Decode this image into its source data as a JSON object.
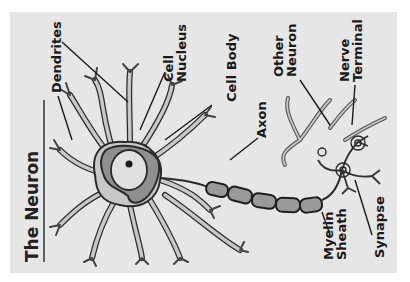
{
  "diagram": {
    "title": "The Neuron",
    "orientation": "rotated 90° counter-clockwise",
    "colors": {
      "panel_background": "#e6e6e6",
      "cell_fill": "#c8c8c8",
      "outline": "#2a2a2a",
      "nucleus_fill": "#e0e0e0",
      "myelin_fill": "#9a9a9a",
      "body_inner": "#8f8f8f"
    },
    "labels": {
      "dendrites": "Dendrites",
      "cell_nucleus_line1": "Cell",
      "cell_nucleus_line2": "Nucleus",
      "cell_body": "Cell Body",
      "axon": "Axon",
      "other_neuron_line1": "Other",
      "other_neuron_line2": "Neuron",
      "nerve_terminal_line1": "Nerve",
      "nerve_terminal_line2": "Terminal",
      "myelin_sheath_line1": "Myelin",
      "myelin_sheath_line2": "Sheath",
      "synapse": "Synapse"
    }
  }
}
